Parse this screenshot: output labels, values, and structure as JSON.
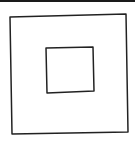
{
  "canvas": {
    "width": 135,
    "height": 143,
    "background": "#ffffff"
  },
  "top_bar": {
    "color": "#1a1a1a"
  },
  "shapes": {
    "stroke_color": "#222222",
    "stroke_width": 1.5,
    "outer_square": {
      "points": "10,17 126,14 128,132 12,134"
    },
    "inner_square": {
      "points": "46,48 93,47 94,91 47,93"
    }
  }
}
